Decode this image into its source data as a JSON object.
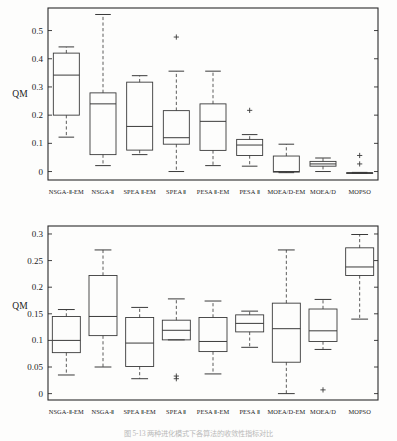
{
  "figure": {
    "caption": "图 5-13 两种进化模式下各算法的收敛性指标对比"
  },
  "chart_data": [
    {
      "id": "top",
      "type": "box",
      "title": "",
      "xlabel": "",
      "ylabel": "QM",
      "ylim": [
        -0.03,
        0.58
      ],
      "yticks": [
        0,
        0.1,
        0.2,
        0.3,
        0.4,
        0.5
      ],
      "yticklabels": [
        "0",
        "0.1",
        "0.2",
        "0.3",
        "0.4",
        "0.5"
      ],
      "grid": false,
      "categories": [
        "NSGA-Ⅱ-EM",
        "NSGA-Ⅱ",
        "SPEA Ⅱ-EM",
        "SPEA Ⅱ",
        "PESA Ⅱ-EM",
        "PESA Ⅱ",
        "MOEA/D-EM",
        "MOEA/D",
        "MOPSO"
      ],
      "boxes": [
        {
          "label": "NSGA-Ⅱ-EM",
          "whisker_low": 0.122,
          "q1": 0.2,
          "median": 0.342,
          "q3": 0.42,
          "whisker_high": 0.442,
          "outliers": []
        },
        {
          "label": "NSGA-Ⅱ",
          "whisker_low": 0.021,
          "q1": 0.06,
          "median": 0.24,
          "q3": 0.279,
          "whisker_high": 0.557,
          "outliers": []
        },
        {
          "label": "SPEA Ⅱ-EM",
          "whisker_low": 0.06,
          "q1": 0.076,
          "median": 0.16,
          "q3": 0.317,
          "whisker_high": 0.34,
          "outliers": []
        },
        {
          "label": "SPEA Ⅱ",
          "whisker_low": 0.0,
          "q1": 0.097,
          "median": 0.12,
          "q3": 0.216,
          "whisker_high": 0.356,
          "outliers": [
            0.477
          ]
        },
        {
          "label": "PESA Ⅱ-EM",
          "whisker_low": 0.021,
          "q1": 0.075,
          "median": 0.178,
          "q3": 0.24,
          "whisker_high": 0.356,
          "outliers": []
        },
        {
          "label": "PESA Ⅱ",
          "whisker_low": 0.019,
          "q1": 0.057,
          "median": 0.094,
          "q3": 0.114,
          "whisker_high": 0.131,
          "outliers": [
            0.217
          ]
        },
        {
          "label": "MOEA/D-EM",
          "whisker_low": -0.004,
          "q1": -0.002,
          "median": 0.0,
          "q3": 0.055,
          "whisker_high": 0.097,
          "outliers": []
        },
        {
          "label": "MOEA/D",
          "whisker_low": 0.0,
          "q1": 0.019,
          "median": 0.027,
          "q3": 0.036,
          "whisker_high": 0.048,
          "outliers": []
        },
        {
          "label": "MOPSO",
          "whisker_low": -0.006,
          "q1": -0.006,
          "median": -0.005,
          "q3": -0.004,
          "whisker_high": -0.003,
          "outliers": [
            0.057,
            0.027
          ]
        }
      ]
    },
    {
      "id": "bottom",
      "type": "box",
      "title": "",
      "xlabel": "",
      "ylabel": "QM",
      "ylim": [
        -0.012,
        0.315
      ],
      "yticks": [
        0,
        0.05,
        0.1,
        0.15,
        0.2,
        0.25,
        0.3
      ],
      "yticklabels": [
        "0",
        "0.05",
        "0.1",
        "0.15",
        "0.2",
        "0.25",
        "0.3"
      ],
      "grid": false,
      "categories": [
        "NSGA-Ⅱ-EM",
        "NSGA-Ⅱ",
        "SPEA Ⅱ-EM",
        "SPEA Ⅱ",
        "PESA Ⅱ-EM",
        "PESA Ⅱ",
        "MOEA/D-EM",
        "MOEA/D",
        "MOPSO"
      ],
      "boxes": [
        {
          "label": "NSGA-Ⅱ-EM",
          "whisker_low": 0.035,
          "q1": 0.077,
          "median": 0.1,
          "q3": 0.145,
          "whisker_high": 0.158,
          "outliers": []
        },
        {
          "label": "NSGA-Ⅱ",
          "whisker_low": 0.05,
          "q1": 0.109,
          "median": 0.145,
          "q3": 0.222,
          "whisker_high": 0.27,
          "outliers": []
        },
        {
          "label": "SPEA Ⅱ-EM",
          "whisker_low": 0.028,
          "q1": 0.051,
          "median": 0.095,
          "q3": 0.143,
          "whisker_high": 0.162,
          "outliers": []
        },
        {
          "label": "SPEA Ⅱ",
          "whisker_low": 0.101,
          "q1": 0.101,
          "median": 0.119,
          "q3": 0.138,
          "whisker_high": 0.178,
          "outliers": [
            0.033,
            0.028
          ]
        },
        {
          "label": "PESA Ⅱ-EM",
          "whisker_low": 0.037,
          "q1": 0.079,
          "median": 0.098,
          "q3": 0.143,
          "whisker_high": 0.174,
          "outliers": []
        },
        {
          "label": "PESA Ⅱ",
          "whisker_low": 0.087,
          "q1": 0.116,
          "median": 0.132,
          "q3": 0.148,
          "whisker_high": 0.155,
          "outliers": []
        },
        {
          "label": "MOEA/D-EM",
          "whisker_low": 0.0,
          "q1": 0.059,
          "median": 0.122,
          "q3": 0.17,
          "whisker_high": 0.27,
          "outliers": []
        },
        {
          "label": "MOEA/D",
          "whisker_low": 0.083,
          "q1": 0.098,
          "median": 0.118,
          "q3": 0.159,
          "whisker_high": 0.177,
          "outliers": [
            0.007
          ]
        },
        {
          "label": "MOPSO",
          "whisker_low": 0.14,
          "q1": 0.222,
          "median": 0.238,
          "q3": 0.274,
          "whisker_high": 0.299,
          "outliers": []
        }
      ]
    }
  ]
}
